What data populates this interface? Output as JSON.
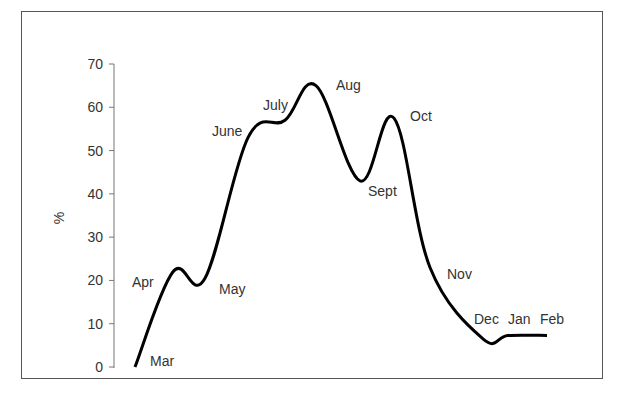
{
  "chart_data": {
    "type": "line",
    "title": "",
    "xlabel": "",
    "ylabel": "%",
    "ylim": [
      0,
      70
    ],
    "yticks": [
      0,
      10,
      20,
      30,
      40,
      50,
      60,
      70
    ],
    "grid": false,
    "legend": null,
    "categories": [
      "Mar",
      "Apr",
      "May",
      "June",
      "July",
      "Aug",
      "Sept",
      "Oct",
      "Nov",
      "Dec",
      "Jan",
      "Feb"
    ],
    "series": [
      {
        "name": "%",
        "values": [
          0,
          22,
          20.5,
          53,
          57,
          65,
          43,
          57.5,
          23,
          6.5,
          7.3,
          7.3
        ]
      }
    ],
    "annotations": [
      {
        "text": "Mar",
        "x": 150,
        "y": 366
      },
      {
        "text": "Apr",
        "x": 132,
        "y": 287
      },
      {
        "text": "May",
        "x": 219,
        "y": 294
      },
      {
        "text": "June",
        "x": 212,
        "y": 136
      },
      {
        "text": "July",
        "x": 263,
        "y": 110
      },
      {
        "text": "Aug",
        "x": 336,
        "y": 90
      },
      {
        "text": "Sept",
        "x": 368,
        "y": 196
      },
      {
        "text": "Oct",
        "x": 410,
        "y": 121
      },
      {
        "text": "Nov",
        "x": 447,
        "y": 279
      },
      {
        "text": "Dec",
        "x": 474,
        "y": 324
      },
      {
        "text": "Jan",
        "x": 508,
        "y": 324
      },
      {
        "text": "Feb",
        "x": 540,
        "y": 324
      }
    ]
  },
  "axis": {
    "ylabel": "%",
    "ticks": [
      "0",
      "10",
      "20",
      "30",
      "40",
      "50",
      "60",
      "70"
    ]
  },
  "months": [
    "Mar",
    "Apr",
    "May",
    "June",
    "July",
    "Aug",
    "Sept",
    "Oct",
    "Nov",
    "Dec",
    "Jan",
    "Feb"
  ]
}
